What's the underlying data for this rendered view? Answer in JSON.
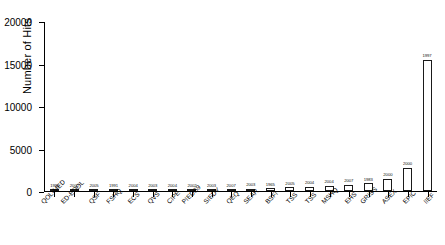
{
  "chart_data": {
    "type": "bar",
    "title": "",
    "subtitle": "",
    "xlabel": "",
    "ylabel": "Number of Hits",
    "ylim": [
      0,
      20000
    ],
    "yticks": [
      0,
      5000,
      10000,
      15000,
      20000
    ],
    "ytick_labels": [
      "0",
      "5000",
      "10000",
      "15000",
      "20000"
    ],
    "grid": false,
    "legend": false,
    "legend_position": "none",
    "bar_color": "#ffffff",
    "bar_edge_color": "#1a1a1a",
    "categories": [
      "QOL-MED",
      "ED-EQOL",
      "QSF",
      "FSHQ",
      "ECS",
      "QVS",
      "CIPE",
      "PIEDS9",
      "SIEDY",
      "QEQ",
      "SEAR",
      "BSFI",
      "TSS",
      "TSS",
      "MSHQ",
      "EHS",
      "GRISS",
      "ASEX",
      "EPIC",
      "IIEF"
    ],
    "point_labels": [
      "1996",
      "2002",
      "2005",
      "1991",
      "2004",
      "2003",
      "2004",
      "2002",
      "2003",
      "2007",
      "2003",
      "1965",
      "2005",
      "2004",
      "2004",
      "2007",
      "1983",
      "2000",
      "2000",
      "1997"
    ],
    "values": [
      60,
      70,
      80,
      85,
      95,
      110,
      120,
      130,
      150,
      170,
      260,
      330,
      430,
      520,
      640,
      760,
      900,
      1450,
      2750,
      15450
    ],
    "values_note": "bar heights read from axis; rightmost bar IIEF is by far the largest"
  }
}
